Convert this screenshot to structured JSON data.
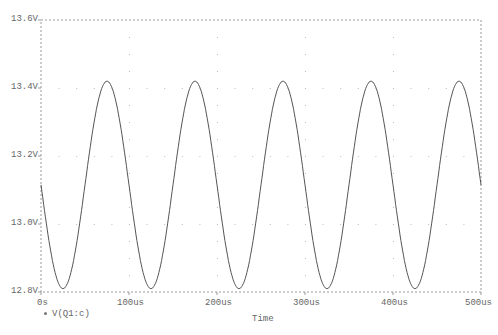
{
  "chart_data": {
    "type": "line",
    "title": "",
    "xlabel": "Time",
    "ylabel": "",
    "xlim": [
      0,
      500
    ],
    "x_unit": "us",
    "ylim": [
      12.8,
      13.6
    ],
    "y_unit": "V",
    "x_ticks": [
      "0s",
      "100us",
      "200us",
      "300us",
      "400us",
      "500us"
    ],
    "y_ticks": [
      "12.8V",
      "13.0V",
      "13.2V",
      "13.4V",
      "13.6V"
    ],
    "grid": "dotted",
    "legend_position": "bottom-left",
    "series": [
      {
        "name": "V(Q1:c)",
        "description": "sinusoid, period 100us (10kHz), offset ~13.115V, amplitude ~0.305V, trough at 25us",
        "x": [
          0,
          25,
          50,
          75,
          100,
          125,
          150,
          175,
          200,
          225,
          250,
          275,
          300,
          325,
          350,
          375,
          400,
          425,
          450,
          475,
          500
        ],
        "values": [
          13.11,
          12.81,
          13.11,
          13.42,
          13.11,
          12.81,
          13.11,
          13.42,
          13.11,
          12.81,
          13.11,
          13.42,
          13.11,
          12.81,
          13.11,
          13.42,
          13.11,
          12.81,
          13.11,
          13.42,
          13.11
        ]
      }
    ]
  },
  "axes": {
    "y_labels": [
      "13.6V",
      "13.4V",
      "13.2V",
      "13.0V",
      "12.8V"
    ],
    "x_labels": [
      "0s",
      "100us",
      "200us",
      "300us",
      "400us",
      "500us"
    ],
    "x_title": "Time"
  },
  "legend": {
    "label": "V(Q1:c)"
  }
}
